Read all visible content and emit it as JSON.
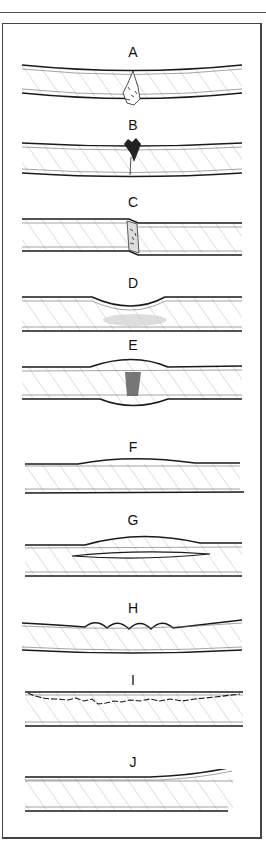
{
  "figure": {
    "panels": [
      {
        "label": "A",
        "defect": "crack through plate"
      },
      {
        "label": "B",
        "defect": "surface crater with partial crack"
      },
      {
        "label": "C",
        "defect": "shear offset fracture"
      },
      {
        "label": "D",
        "defect": "surface depression with subsurface damage"
      },
      {
        "label": "E",
        "defect": "bulge on both faces with internal damage"
      },
      {
        "label": "F",
        "defect": "slight surface swelling"
      },
      {
        "label": "G",
        "defect": "internal delamination with surface bulge"
      },
      {
        "label": "H",
        "defect": "surface wrinkling / buckling"
      },
      {
        "label": "I",
        "defect": "subsurface cracking line"
      },
      {
        "label": "J",
        "defect": "edge peel / skin separation"
      }
    ]
  },
  "colors": {
    "line": "#1a1a1a",
    "hatch": "#9a9a9a",
    "frame": "#444444"
  }
}
